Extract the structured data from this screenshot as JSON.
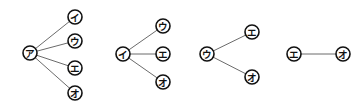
{
  "diagram": {
    "colors": {
      "background": "#ffffff",
      "node_stroke": "#111111",
      "edge": "#6b6b6b",
      "label": "#111111"
    },
    "trees": [
      {
        "root": {
          "id": "a1",
          "label": "ア",
          "x": 30,
          "y": 53
        },
        "children": [
          {
            "id": "i1",
            "label": "イ",
            "x": 75,
            "y": 17
          },
          {
            "id": "u1",
            "label": "ウ",
            "x": 75,
            "y": 41
          },
          {
            "id": "e1",
            "label": "エ",
            "x": 75,
            "y": 68
          },
          {
            "id": "o1",
            "label": "オ",
            "x": 75,
            "y": 93
          }
        ]
      },
      {
        "root": {
          "id": "i2",
          "label": "イ",
          "x": 123,
          "y": 54
        },
        "children": [
          {
            "id": "u2",
            "label": "ウ",
            "x": 163,
            "y": 26
          },
          {
            "id": "e2",
            "label": "エ",
            "x": 163,
            "y": 54
          },
          {
            "id": "o2",
            "label": "オ",
            "x": 163,
            "y": 82
          }
        ]
      },
      {
        "root": {
          "id": "u3",
          "label": "ウ",
          "x": 207,
          "y": 54
        },
        "children": [
          {
            "id": "e3",
            "label": "エ",
            "x": 252,
            "y": 32
          },
          {
            "id": "o3",
            "label": "オ",
            "x": 252,
            "y": 77
          }
        ]
      },
      {
        "root": {
          "id": "e4",
          "label": "エ",
          "x": 294,
          "y": 54
        },
        "children": [
          {
            "id": "o4",
            "label": "オ",
            "x": 343,
            "y": 54
          }
        ]
      }
    ],
    "node_radius": 7
  }
}
